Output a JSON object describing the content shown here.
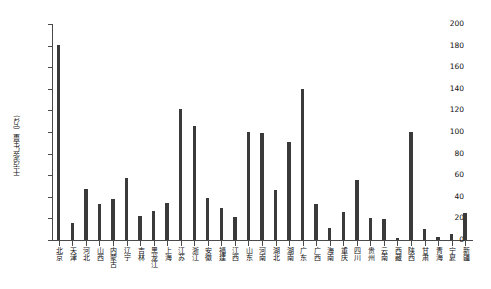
{
  "chart_data": {
    "type": "bar",
    "title": "",
    "xlabel": "",
    "ylabel": "干污泥产生量（万t)",
    "ylim": [
      0,
      200
    ],
    "yticks": [
      0,
      20,
      40,
      60,
      80,
      100,
      120,
      140,
      160,
      180,
      200
    ],
    "grid": false,
    "legend": false,
    "bar_color": "#3a3a3a",
    "axis_color": "#4a4a4a",
    "categories": [
      "北京",
      "天津",
      "河北",
      "山西",
      "内蒙古",
      "辽宁",
      "吉林",
      "黑龙江",
      "上海",
      "江苏",
      "浙江",
      "安徽",
      "福建",
      "江西",
      "山东",
      "河南",
      "湖北",
      "湖南",
      "广东",
      "广西",
      "海南",
      "重庆",
      "四川",
      "贵州",
      "云南",
      "西藏",
      "陕西",
      "甘肃",
      "青海",
      "宁夏",
      "新疆"
    ],
    "values": [
      181,
      16,
      47,
      33,
      38,
      57,
      22,
      27,
      34,
      121,
      106,
      39,
      30,
      21,
      100,
      99,
      46,
      91,
      140,
      33,
      11,
      26,
      56,
      20,
      19,
      1.5,
      100,
      10,
      3,
      6,
      25
    ]
  }
}
